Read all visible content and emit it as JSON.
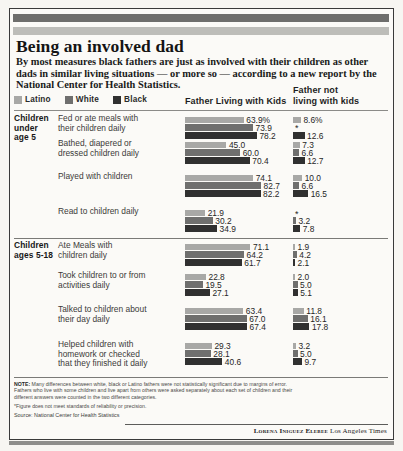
{
  "title": "Being an involved dad",
  "deck": "By most measures black fathers are just as involved with their children as other dads in similar living situations — or more so — according to a new report by the National Center for Health Statistics.",
  "legend": [
    {
      "key": "latino",
      "label": "Latino",
      "color": "#a8a8a6"
    },
    {
      "key": "white",
      "label": "White",
      "color": "#6f6f6e"
    },
    {
      "key": "black",
      "label": "Black",
      "color": "#303030"
    }
  ],
  "columns": {
    "living_with": "Father Living with Kids",
    "not_living_with_1": "Father not",
    "not_living_with_2": "living with kids"
  },
  "groups": [
    {
      "label_1": "Children",
      "label_2": "under",
      "label_3": "age 5",
      "rows": [
        {
          "label_1": "Fed or ate meals with",
          "label_2": "their children daily",
          "living": [
            {
              "series": "latino",
              "value": 63.9,
              "display": "63.9%"
            },
            {
              "series": "white",
              "value": 73.9,
              "display": "73.9"
            },
            {
              "series": "black",
              "value": 78.2,
              "display": "78.2"
            }
          ],
          "not_living": [
            {
              "series": "latino",
              "value": 8.6,
              "display": "8.6%"
            },
            {
              "series": "white",
              "value": null,
              "display": "*"
            },
            {
              "series": "black",
              "value": 12.6,
              "display": "12.6"
            }
          ]
        },
        {
          "label_1": "Bathed, diapered or",
          "label_2": "dressed children daily",
          "living": [
            {
              "series": "latino",
              "value": 45.0,
              "display": "45.0"
            },
            {
              "series": "white",
              "value": 60.0,
              "display": "60.0"
            },
            {
              "series": "black",
              "value": 70.4,
              "display": "70.4"
            }
          ],
          "not_living": [
            {
              "series": "latino",
              "value": 7.3,
              "display": "7.3"
            },
            {
              "series": "white",
              "value": 6.6,
              "display": "6.6"
            },
            {
              "series": "black",
              "value": 12.7,
              "display": "12.7"
            }
          ]
        },
        {
          "label_1": "Played with children",
          "label_2": "",
          "living": [
            {
              "series": "latino",
              "value": 74.1,
              "display": "74.1"
            },
            {
              "series": "white",
              "value": 82.7,
              "display": "82.7"
            },
            {
              "series": "black",
              "value": 82.2,
              "display": "82.2"
            }
          ],
          "not_living": [
            {
              "series": "latino",
              "value": 10.0,
              "display": "10.0"
            },
            {
              "series": "white",
              "value": 6.6,
              "display": "6.6"
            },
            {
              "series": "black",
              "value": 16.5,
              "display": "16.5"
            }
          ]
        },
        {
          "label_1": "Read to children daily",
          "label_2": "",
          "living": [
            {
              "series": "latino",
              "value": 21.9,
              "display": "21.9"
            },
            {
              "series": "white",
              "value": 30.2,
              "display": "30.2"
            },
            {
              "series": "black",
              "value": 34.9,
              "display": "34.9"
            }
          ],
          "not_living": [
            {
              "series": "latino",
              "value": null,
              "display": "*"
            },
            {
              "series": "white",
              "value": 3.2,
              "display": "3.2"
            },
            {
              "series": "black",
              "value": 7.8,
              "display": "7.8"
            }
          ]
        }
      ]
    },
    {
      "label_1": "Children",
      "label_2": "ages 5-18",
      "label_3": "",
      "rows": [
        {
          "label_1": "Ate Meals with",
          "label_2": "children daily",
          "living": [
            {
              "series": "latino",
              "value": 71.1,
              "display": "71.1"
            },
            {
              "series": "white",
              "value": 64.2,
              "display": "64.2"
            },
            {
              "series": "black",
              "value": 61.7,
              "display": "61.7"
            }
          ],
          "not_living": [
            {
              "series": "latino",
              "value": 1.9,
              "display": "1.9"
            },
            {
              "series": "white",
              "value": 4.2,
              "display": "4.2"
            },
            {
              "series": "black",
              "value": 2.1,
              "display": "2.1"
            }
          ]
        },
        {
          "label_1": "Took children to or from",
          "label_2": "activities daily",
          "living": [
            {
              "series": "latino",
              "value": 22.8,
              "display": "22.8"
            },
            {
              "series": "white",
              "value": 19.5,
              "display": "19.5"
            },
            {
              "series": "black",
              "value": 27.1,
              "display": "27.1"
            }
          ],
          "not_living": [
            {
              "series": "latino",
              "value": 2.0,
              "display": "2.0"
            },
            {
              "series": "white",
              "value": 5.0,
              "display": "5.0"
            },
            {
              "series": "black",
              "value": 5.1,
              "display": "5.1"
            }
          ]
        },
        {
          "label_1": "Talked to children about",
          "label_2": "their day daily",
          "living": [
            {
              "series": "latino",
              "value": 63.4,
              "display": "63.4"
            },
            {
              "series": "white",
              "value": 67.0,
              "display": "67.0"
            },
            {
              "series": "black",
              "value": 67.4,
              "display": "67.4"
            }
          ],
          "not_living": [
            {
              "series": "latino",
              "value": 11.8,
              "display": "11.8"
            },
            {
              "series": "white",
              "value": 16.1,
              "display": "16.1"
            },
            {
              "series": "black",
              "value": 17.8,
              "display": "17.8"
            }
          ]
        },
        {
          "label_1": "Helped children with",
          "label_2": "homework or checked",
          "label_3": "that they finished it daily",
          "living": [
            {
              "series": "latino",
              "value": 29.3,
              "display": "29.3"
            },
            {
              "series": "white",
              "value": 28.1,
              "display": "28.1"
            },
            {
              "series": "black",
              "value": 40.6,
              "display": "40.6"
            }
          ],
          "not_living": [
            {
              "series": "latino",
              "value": 3.2,
              "display": "3.2"
            },
            {
              "series": "white",
              "value": 5.0,
              "display": "5.0"
            },
            {
              "series": "black",
              "value": 9.7,
              "display": "9.7"
            }
          ]
        }
      ]
    }
  ],
  "note_label": "NOTE:",
  "note_line_1": "Many differences between white, black or Latino fathers were not statistically significant due to margins of error.",
  "note_line_2": "Fathers who live with some children and live apart from others were asked separately about each set of children and their",
  "note_line_3": "different answers were counted in the two different categories.",
  "footnote_star": "*Figure does not meet standards of reliability or precision.",
  "source": "Source: National Center for Health Statistics",
  "credit_name": "Lorena Iniguez Elebee",
  "credit_org": "Los Angeles Times",
  "chart_data": {
    "type": "bar",
    "title": "Being an involved dad",
    "orientation": "horizontal",
    "series": [
      "Latino",
      "White",
      "Black"
    ],
    "panels": [
      "Father Living with Kids",
      "Father not living with kids"
    ],
    "xlabel": "Percent",
    "ylabel": "",
    "xlim": [
      0,
      100
    ],
    "grid": false,
    "legend_position": "top-left",
    "categories": [
      "Fed or ate meals with their children daily",
      "Bathed, diapered or dressed children daily",
      "Played with children",
      "Read to children daily",
      "Ate Meals with children daily",
      "Took children to or from activities daily",
      "Talked to children about their day daily",
      "Helped children with homework or checked that they finished it daily"
    ],
    "living_with_kids": {
      "Latino": [
        63.9,
        45.0,
        74.1,
        21.9,
        71.1,
        22.8,
        63.4,
        29.3
      ],
      "White": [
        73.9,
        60.0,
        82.7,
        30.2,
        64.2,
        19.5,
        67.0,
        28.1
      ],
      "Black": [
        78.2,
        70.4,
        82.2,
        34.9,
        61.7,
        27.1,
        67.4,
        40.6
      ]
    },
    "not_living_with_kids": {
      "Latino": [
        8.6,
        7.3,
        10.0,
        null,
        1.9,
        2.0,
        11.8,
        3.2
      ],
      "White": [
        null,
        6.6,
        6.6,
        3.2,
        4.2,
        5.0,
        16.1,
        5.0
      ],
      "Black": [
        12.6,
        12.7,
        16.5,
        7.8,
        2.1,
        5.1,
        17.8,
        9.7
      ]
    },
    "annotations": [
      "* Figure does not meet standards of reliability or precision."
    ]
  }
}
